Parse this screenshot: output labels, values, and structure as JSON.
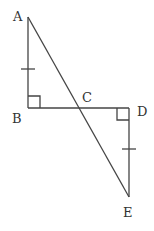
{
  "diagram": {
    "points": {
      "A": {
        "label": "A",
        "x": 28,
        "y": 17,
        "lx": 13,
        "ly": 21
      },
      "B": {
        "label": "B",
        "x": 28,
        "y": 108,
        "lx": 12,
        "ly": 123
      },
      "C": {
        "label": "C",
        "x": 80,
        "y": 108,
        "lx": 82,
        "ly": 102
      },
      "D": {
        "label": "D",
        "x": 129,
        "y": 108,
        "lx": 137,
        "ly": 116
      },
      "E": {
        "label": "E",
        "x": 129,
        "y": 197,
        "lx": 123,
        "ly": 217
      }
    },
    "segments": [
      "AB",
      "BD",
      "DE",
      "AE"
    ],
    "right_angles": [
      "B",
      "D"
    ],
    "congruent_marks": [
      "AB",
      "DE"
    ]
  }
}
